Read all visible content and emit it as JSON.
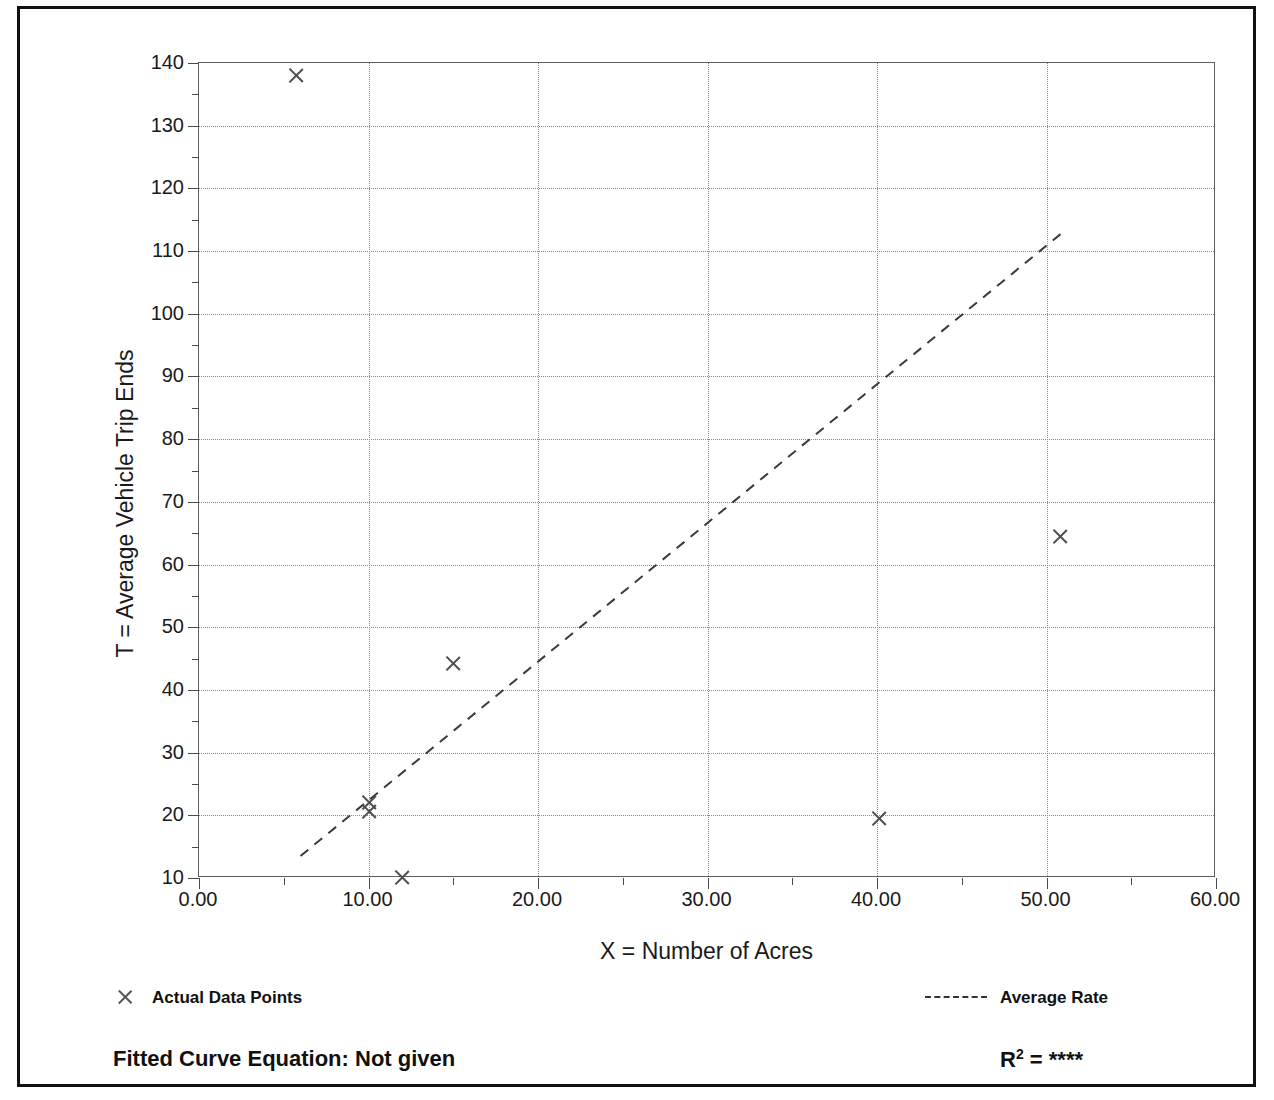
{
  "chart_data": {
    "type": "scatter",
    "title": "",
    "xlabel": "X = Number of Acres",
    "ylabel": "T = Average Vehicle Trip Ends",
    "xlim": [
      0,
      60
    ],
    "ylim": [
      10,
      140
    ],
    "grid": true,
    "x_ticks": [
      "0.00",
      "10.00",
      "20.00",
      "30.00",
      "40.00",
      "50.00",
      "60.00"
    ],
    "x_tick_values": [
      0,
      10,
      20,
      30,
      40,
      50,
      60
    ],
    "x_minor_step": 5,
    "y_ticks": [
      "10",
      "20",
      "30",
      "40",
      "50",
      "60",
      "70",
      "80",
      "90",
      "100",
      "110",
      "120",
      "130",
      "140"
    ],
    "y_tick_values": [
      10,
      20,
      30,
      40,
      50,
      60,
      70,
      80,
      90,
      100,
      110,
      120,
      130,
      140
    ],
    "y_minor_step": 5,
    "series": [
      {
        "name": "Actual Data Points",
        "type": "scatter",
        "marker": "x",
        "color": "#4d4d4d",
        "points": [
          {
            "x": 5.7,
            "y": 138.0
          },
          {
            "x": 10.0,
            "y": 22.0
          },
          {
            "x": 10.0,
            "y": 20.6
          },
          {
            "x": 12.0,
            "y": 10.1
          },
          {
            "x": 15.0,
            "y": 44.2
          },
          {
            "x": 40.1,
            "y": 19.5
          },
          {
            "x": 50.8,
            "y": 64.5
          }
        ]
      },
      {
        "name": "Average Rate",
        "type": "line",
        "style": "dashed",
        "color": "#3a3a3a",
        "endpoints": [
          {
            "x": 6.0,
            "y": 13.2
          },
          {
            "x": 51.0,
            "y": 112.8
          }
        ]
      }
    ],
    "legend_position": "below-plot",
    "legend": [
      {
        "label": "Actual Data Points",
        "marker": "x"
      },
      {
        "label": "Average Rate",
        "marker": "dashed-line"
      }
    ],
    "annotations": {
      "fitted_curve_equation": "Fitted Curve Equation:  Not given",
      "r_squared_label": "R",
      "r_squared_exponent": "2",
      "r_squared_equals": " = ",
      "r_squared_value": "****"
    }
  },
  "colors": {
    "frame": "#111111",
    "axis": "#5d5d5d",
    "grid": "#8a8a8a",
    "marker": "#4d4d4d",
    "trend": "#3a3a3a",
    "text": "#1a1a1a",
    "background": "#ffffff"
  }
}
